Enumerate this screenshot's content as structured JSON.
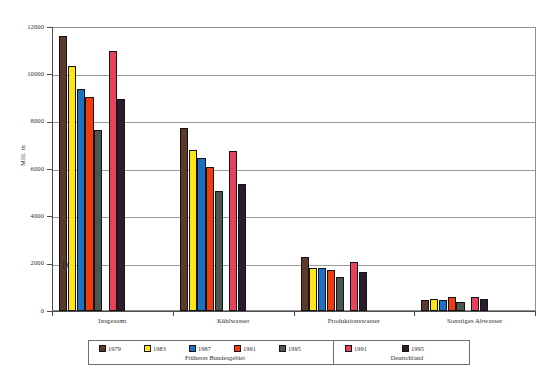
{
  "chart_data": {
    "type": "bar",
    "title": "",
    "xlabel": "",
    "ylabel": "Mill. m",
    "ylim": [
      0,
      12000
    ],
    "ytick_step": 2000,
    "yticks": [
      "0",
      "2000",
      "4000",
      "6000",
      "8000",
      "10000",
      "12000"
    ],
    "grid": true,
    "legend_position": "bottom",
    "categories": [
      "Insgesamt",
      "Kühlwasser",
      "Produktionswasser",
      "Sonstiges Abwasser"
    ],
    "series": [
      {
        "name": "1979",
        "group": "Früheres Bundesgebiet",
        "color": "#5C3A2A",
        "values": [
          11600,
          7750,
          2300,
          450
        ]
      },
      {
        "name": "1983",
        "group": "Früheres Bundesgebiet",
        "color": "#FFE516",
        "values": [
          10350,
          6800,
          1800,
          500
        ]
      },
      {
        "name": "1987",
        "group": "Früheres Bundesgebiet",
        "color": "#1E70C0",
        "values": [
          9400,
          6450,
          1800,
          450
        ]
      },
      {
        "name": "1991",
        "group": "Früheres Bundesgebiet",
        "color": "#F03A10",
        "values": [
          9050,
          6100,
          1750,
          600
        ]
      },
      {
        "name": "1995",
        "group": "Früheres Bundesgebiet",
        "color": "#4A5750",
        "values": [
          7650,
          5050,
          1450,
          400
        ]
      },
      {
        "name": "1991",
        "group": "Deutschland",
        "color": "#E8415C",
        "values": [
          11000,
          6750,
          2050,
          600
        ]
      },
      {
        "name": "1995",
        "group": "Deutschland",
        "color": "#2B1B2E",
        "values": [
          8950,
          5350,
          1650,
          500
        ]
      }
    ],
    "annotations": [
      "0"
    ]
  },
  "axis": {
    "y_title": "Mill. m",
    "tick_labels": [
      "12000",
      "10000",
      "8000",
      "6000",
      "4000",
      "2000",
      "0"
    ],
    "category_labels": [
      "Insgesamt",
      "Kühlwasser",
      "Produktionswasser",
      "Sonstiges Abwasser"
    ]
  },
  "legend": {
    "groups": [
      {
        "title": "Früheres Bundesgebiet",
        "entries": [
          {
            "label": "1979",
            "color": "#5C3A2A"
          },
          {
            "label": "1983",
            "color": "#FFE516"
          },
          {
            "label": "1987",
            "color": "#1E70C0"
          },
          {
            "label": "1991",
            "color": "#F03A10"
          },
          {
            "label": "1995",
            "color": "#4A5750"
          }
        ]
      },
      {
        "title": "Deutschland",
        "entries": [
          {
            "label": "1991",
            "color": "#E8415C"
          },
          {
            "label": "1995",
            "color": "#2B1B2E"
          }
        ]
      }
    ]
  },
  "artifacts": {
    "stray_zero": "0"
  }
}
